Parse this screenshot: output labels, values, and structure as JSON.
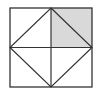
{
  "figure": {
    "square": {
      "x1": 10,
      "y1": 8,
      "x2": 92,
      "y2": 87
    },
    "center": {
      "x": 51,
      "y": 47.5
    },
    "shaded_quadrant": "top-right",
    "colors": {
      "line": "#333333",
      "shade": "#d9d9d9",
      "background": "#ffffff"
    }
  }
}
